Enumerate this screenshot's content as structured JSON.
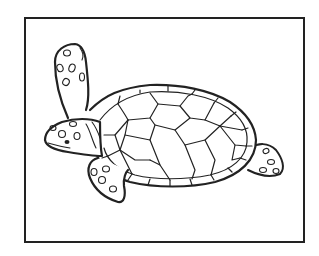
{
  "image": {
    "subject": "sea turtle line drawing",
    "style": "black outline coloring-page illustration",
    "colors": {
      "line": "#222222",
      "background": "#ffffff",
      "frame": "#222222"
    }
  }
}
